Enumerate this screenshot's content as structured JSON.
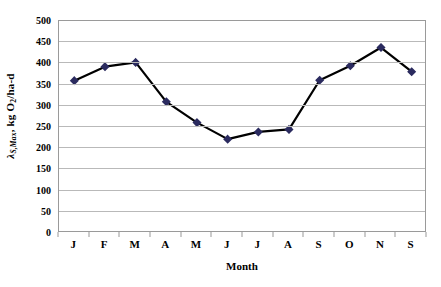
{
  "chart_data": {
    "type": "line",
    "title": "",
    "subtitle": "",
    "xlabel": "Month",
    "ylabel": "λS,Max, kg O2/ha-d",
    "ylabel_parts": {
      "symbol": "λ",
      "symbol_subscript": "S,Max",
      "rest": ", kg O",
      "rest_subscript": "2",
      "tail": "/ha-d"
    },
    "categories": [
      "J",
      "F",
      "M",
      "A",
      "M",
      "J",
      "J",
      "A",
      "S",
      "O",
      "N",
      "S"
    ],
    "values": [
      357,
      390,
      400,
      307,
      258,
      219,
      236,
      242,
      358,
      392,
      435,
      378
    ],
    "ylim": [
      0,
      500
    ],
    "ytick_step": 50,
    "yticks": [
      500,
      450,
      400,
      350,
      300,
      250,
      200,
      150,
      100,
      50,
      0
    ],
    "grid": "horizontal",
    "legend": "none",
    "series": [
      {
        "name": "lambda-s-max",
        "values": [
          357,
          390,
          400,
          307,
          258,
          219,
          236,
          242,
          358,
          392,
          435,
          378
        ],
        "marker": "diamond",
        "marker_color": "#2b2b5f",
        "line_color": "#000000"
      }
    ]
  },
  "colors": {
    "marker": "#2b2b5f",
    "line": "#000000",
    "gridline": "#b9b9b9",
    "axis": "#9a9a9a",
    "background": "#ffffff",
    "text": "#000000"
  }
}
